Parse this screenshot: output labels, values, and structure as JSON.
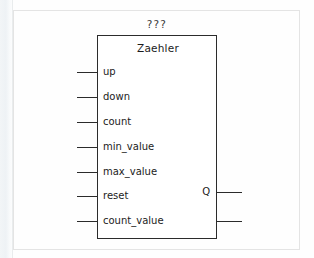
{
  "diagram": {
    "title": "???",
    "block": {
      "instance_name": "Zaehler",
      "geometry": {
        "left": 97,
        "top": 35,
        "width": 120,
        "height": 204
      }
    },
    "inputs": [
      {
        "label": "up",
        "y": 72
      },
      {
        "label": "down",
        "y": 97
      },
      {
        "label": "count",
        "y": 122
      },
      {
        "label": "min_value",
        "y": 147
      },
      {
        "label": "max_value",
        "y": 172
      },
      {
        "label": "reset",
        "y": 196
      },
      {
        "label": "count_value",
        "y": 221
      }
    ],
    "outputs": [
      {
        "label": "Q",
        "y": 192,
        "style": "solid"
      },
      {
        "label": "",
        "y": 221,
        "style": "solid"
      }
    ],
    "internal_connections": [
      {
        "from": "count_value",
        "style": "dashed",
        "y": 221,
        "x_start": 163,
        "x_end": 217
      }
    ],
    "colors": {
      "line": "#2b2b2b",
      "text": "#1c1c1c",
      "background": "#fefefe",
      "frame": "#e4e4e4"
    }
  }
}
